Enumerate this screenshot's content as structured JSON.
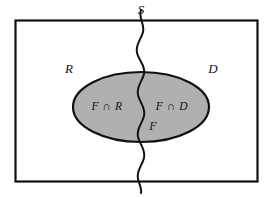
{
  "figure": {
    "type": "venn-diagram",
    "colors": {
      "background": "#ffffff",
      "stroke": "#111111",
      "subset_fill": "#b0b0b0",
      "label_color": "#111111"
    }
  },
  "labels": {
    "universe": "S",
    "region_left": "R",
    "region_right": "D",
    "subset": "F",
    "intersection_left": "F ∩ R",
    "intersection_right": "F ∩ D",
    "intersect_symbol": "∩",
    "set_f": "F",
    "set_r": "R",
    "set_d": "D"
  },
  "geometry": {
    "rect": {
      "x": 15,
      "y": 20,
      "width": 243,
      "height": 162
    },
    "ellipse": {
      "cx": 141,
      "cy": 107,
      "rx": 68,
      "ry": 35
    },
    "divider_x": 141,
    "divider_top_y": 10,
    "divider_bottom_y": 193
  },
  "label_positions": {
    "universe": {
      "x": 141,
      "y": 11
    },
    "region_left": {
      "x": 69,
      "y": 70
    },
    "region_right": {
      "x": 213,
      "y": 70
    },
    "intersection_left": {
      "x": 107,
      "y": 107
    },
    "intersection_right": {
      "x": 172,
      "y": 107
    },
    "subset": {
      "x": 153,
      "y": 127
    }
  }
}
